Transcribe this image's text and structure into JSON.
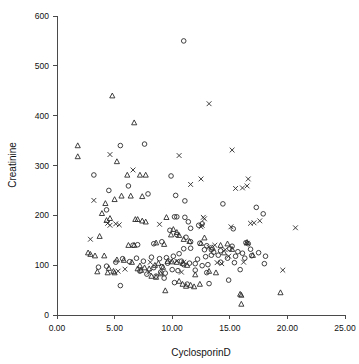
{
  "chart_data": {
    "type": "scatter",
    "title": "",
    "xlabel": "CyclosporinD",
    "ylabel": "Creatinine",
    "xlim": [
      0,
      25
    ],
    "ylim": [
      0,
      600
    ],
    "xticks": [
      "0.00",
      "5.00",
      "10.00",
      "15.00",
      "20.00",
      "25.00"
    ],
    "xtick_values": [
      0,
      5,
      10,
      15,
      20,
      25
    ],
    "yticks": [
      "0",
      "100",
      "200",
      "300",
      "400",
      "500",
      "600"
    ],
    "ytick_values": [
      0,
      100,
      200,
      300,
      400,
      500,
      600
    ],
    "grid": false,
    "legend": "none",
    "marker_kinds": [
      "circle",
      "triangle",
      "cross"
    ],
    "series": [
      {
        "name": "circle",
        "marker": "circle",
        "points": [
          [
            11.0,
            550
          ],
          [
            5.5,
            340
          ],
          [
            7.6,
            343
          ],
          [
            3.2,
            281
          ],
          [
            9.9,
            279
          ],
          [
            4.5,
            250
          ],
          [
            6.2,
            259
          ],
          [
            7.9,
            243
          ],
          [
            10.3,
            240
          ],
          [
            11.1,
            229
          ],
          [
            14.4,
            223
          ],
          [
            17.9,
            203
          ],
          [
            17.3,
            216
          ],
          [
            4.3,
            211
          ],
          [
            10.4,
            197
          ],
          [
            11.1,
            196
          ],
          [
            10.2,
            197
          ],
          [
            11.4,
            187
          ],
          [
            12.6,
            183
          ],
          [
            11.6,
            174
          ],
          [
            15.3,
            173
          ],
          [
            12.3,
            180
          ],
          [
            9.8,
            170
          ],
          [
            10.4,
            161
          ],
          [
            11.2,
            156
          ],
          [
            11.6,
            147
          ],
          [
            12.4,
            144
          ],
          [
            13.0,
            139
          ],
          [
            13.4,
            131
          ],
          [
            12.8,
            131
          ],
          [
            16.4,
            145
          ],
          [
            16.6,
            143
          ],
          [
            15.2,
            138
          ],
          [
            15.0,
            133
          ],
          [
            16.8,
            132
          ],
          [
            17.5,
            125
          ],
          [
            18.1,
            118
          ],
          [
            16.9,
            119
          ],
          [
            18.0,
            103
          ],
          [
            15.4,
            105
          ],
          [
            14.2,
            106
          ],
          [
            14.0,
            120
          ],
          [
            13.4,
            120
          ],
          [
            12.9,
            117
          ],
          [
            12.2,
            112
          ],
          [
            11.6,
            134
          ],
          [
            11.0,
            133
          ],
          [
            10.6,
            123
          ],
          [
            10.1,
            118
          ],
          [
            9.5,
            115
          ],
          [
            8.9,
            113
          ],
          [
            8.2,
            116
          ],
          [
            7.5,
            108
          ],
          [
            6.9,
            114
          ],
          [
            6.3,
            107
          ],
          [
            5.7,
            113
          ],
          [
            5.1,
            106
          ],
          [
            4.3,
            98
          ],
          [
            3.6,
            96
          ],
          [
            5.5,
            59
          ],
          [
            7.2,
            88
          ],
          [
            7.8,
            82
          ],
          [
            8.4,
            95
          ],
          [
            9.1,
            97
          ],
          [
            9.6,
            104
          ],
          [
            10.0,
            91
          ],
          [
            10.5,
            89
          ],
          [
            11.0,
            101
          ],
          [
            11.5,
            104
          ],
          [
            12.0,
            103
          ],
          [
            12.6,
            99
          ],
          [
            13.1,
            101
          ],
          [
            13.6,
            126
          ],
          [
            14.2,
            129
          ],
          [
            14.8,
            114
          ],
          [
            15.5,
            118
          ],
          [
            15.9,
            91
          ],
          [
            14.9,
            70
          ],
          [
            13.2,
            63
          ],
          [
            11.3,
            62
          ],
          [
            10.2,
            65
          ],
          [
            9.3,
            74
          ],
          [
            8.6,
            78
          ],
          [
            6.6,
            140
          ],
          [
            7.0,
            141
          ],
          [
            8.4,
            143
          ],
          [
            9.1,
            147
          ],
          [
            10.8,
            108
          ],
          [
            12.0,
            90
          ],
          [
            13.0,
            85
          ],
          [
            15.7,
            127
          ],
          [
            16.1,
            124
          ],
          [
            16.3,
            114
          ],
          [
            9.0,
            86
          ],
          [
            9.4,
            84
          ]
        ]
      },
      {
        "name": "triangle",
        "marker": "triangle",
        "points": [
          [
            1.8,
            340
          ],
          [
            1.8,
            318
          ],
          [
            4.8,
            440
          ],
          [
            6.7,
            386
          ],
          [
            6.1,
            281
          ],
          [
            7.2,
            281
          ],
          [
            7.7,
            281
          ],
          [
            5.2,
            308
          ],
          [
            5.6,
            239
          ],
          [
            5.0,
            232
          ],
          [
            6.4,
            239
          ],
          [
            7.4,
            238
          ],
          [
            4.2,
            224
          ],
          [
            3.9,
            204
          ],
          [
            4.6,
            194
          ],
          [
            4.3,
            190
          ],
          [
            6.8,
            192
          ],
          [
            7.0,
            192
          ],
          [
            7.4,
            189
          ],
          [
            7.7,
            187
          ],
          [
            9.5,
            196
          ],
          [
            10.1,
            172
          ],
          [
            10.4,
            166
          ],
          [
            9.9,
            161
          ],
          [
            10.6,
            160
          ],
          [
            3.7,
            158
          ],
          [
            6.2,
            140
          ],
          [
            6.7,
            140
          ],
          [
            8.6,
            145
          ],
          [
            9.3,
            142
          ],
          [
            4.1,
            119
          ],
          [
            5.2,
            111
          ],
          [
            5.8,
            110
          ],
          [
            6.5,
            106
          ],
          [
            7.2,
            99
          ],
          [
            7.6,
            95
          ],
          [
            8.0,
            93
          ],
          [
            8.5,
            100
          ],
          [
            8.8,
            104
          ],
          [
            9.2,
            96
          ],
          [
            4.5,
            94
          ],
          [
            4.9,
            88
          ],
          [
            5.0,
            85
          ],
          [
            4.4,
            85
          ],
          [
            3.5,
            87
          ],
          [
            2.7,
            125
          ],
          [
            2.9,
            122
          ],
          [
            3.3,
            119
          ],
          [
            7.0,
            93
          ],
          [
            7.3,
            90
          ],
          [
            9.6,
            108
          ],
          [
            10.0,
            107
          ],
          [
            10.4,
            106
          ],
          [
            10.9,
            104
          ],
          [
            11.3,
            100
          ],
          [
            10.6,
            68
          ],
          [
            10.9,
            62
          ],
          [
            11.2,
            58
          ],
          [
            11.6,
            60
          ],
          [
            11.9,
            57
          ],
          [
            12.4,
            62
          ],
          [
            9.4,
            49
          ],
          [
            15.9,
            42
          ],
          [
            16.0,
            40
          ],
          [
            19.4,
            45
          ],
          [
            16.0,
            22
          ],
          [
            13.5,
            135
          ],
          [
            14.2,
            140
          ],
          [
            14.8,
            143
          ],
          [
            16.5,
            146
          ],
          [
            12.5,
            144
          ],
          [
            11.5,
            148
          ],
          [
            11.0,
            152
          ],
          [
            12.8,
            155
          ],
          [
            13.2,
            88
          ],
          [
            13.8,
            85
          ],
          [
            12.0,
            81
          ],
          [
            8.2,
            78
          ],
          [
            8.6,
            76
          ],
          [
            9.0,
            83
          ],
          [
            17.0,
            120
          ],
          [
            15.2,
            132
          ],
          [
            14.5,
            125
          ]
        ]
      },
      {
        "name": "cross",
        "marker": "cross",
        "points": [
          [
            13.2,
            424
          ],
          [
            10.6,
            320
          ],
          [
            15.2,
            331
          ],
          [
            4.6,
            322
          ],
          [
            6.6,
            291
          ],
          [
            3.2,
            230
          ],
          [
            11.6,
            262
          ],
          [
            12.5,
            273
          ],
          [
            16.6,
            273
          ],
          [
            16.5,
            259
          ],
          [
            16.1,
            255
          ],
          [
            15.5,
            254
          ],
          [
            17.6,
            189
          ],
          [
            17.1,
            185
          ],
          [
            16.8,
            184
          ],
          [
            20.7,
            175
          ],
          [
            15.1,
            177
          ],
          [
            12.7,
            196
          ],
          [
            12.8,
            193
          ],
          [
            12.6,
            180
          ],
          [
            12.5,
            177
          ],
          [
            4.4,
            184
          ],
          [
            4.6,
            180
          ],
          [
            5.4,
            181
          ],
          [
            2.9,
            152
          ],
          [
            8.9,
            182
          ],
          [
            19.6,
            90
          ],
          [
            13.7,
            140
          ],
          [
            16.5,
            144
          ],
          [
            13.2,
            136
          ],
          [
            14.6,
            131
          ],
          [
            14.9,
            118
          ],
          [
            11.0,
            106
          ],
          [
            10.4,
            108
          ],
          [
            9.9,
            109
          ],
          [
            5.9,
            92
          ],
          [
            8.1,
            106
          ],
          [
            16.2,
            106
          ],
          [
            13.9,
            105
          ],
          [
            14.3,
            103
          ],
          [
            10.8,
            86
          ],
          [
            8.0,
            86
          ],
          [
            5.1,
            183
          ],
          [
            5.3,
            88
          ]
        ]
      }
    ]
  },
  "axes": {
    "x_title": "CyclosporinD",
    "y_title": "Creatinine"
  }
}
